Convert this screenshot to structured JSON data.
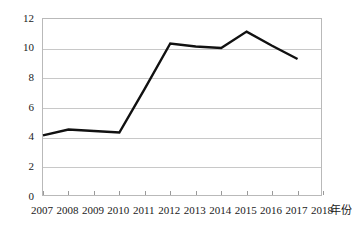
{
  "chart_data": {
    "type": "line",
    "title": "",
    "xlabel": "年份",
    "ylabel": "",
    "categories": [
      "2007",
      "2008",
      "2009",
      "2010",
      "2011",
      "2012",
      "2013",
      "2014",
      "2015",
      "2016",
      "2017",
      "2018"
    ],
    "x_tick_labels": [
      "2007",
      "2008",
      "2009",
      "2010",
      "2011",
      "2012",
      "2013",
      "2014",
      "2015",
      "2016",
      "2017",
      "2018"
    ],
    "y_tick_labels": [
      "0",
      "2",
      "4",
      "6",
      "8",
      "10",
      "12"
    ],
    "y_ticks": [
      0,
      2,
      4,
      6,
      8,
      10,
      12
    ],
    "ylim": [
      0,
      12
    ],
    "xlim": [
      "2007",
      "2018"
    ],
    "grid": "horizontal",
    "legend": "none",
    "series": [
      {
        "name": "series-1",
        "color": "#111111",
        "line_width": 2.4,
        "x": [
          "2007",
          "2008",
          "2009",
          "2010",
          "2011",
          "2012",
          "2013",
          "2014",
          "2015",
          "2016",
          "2017"
        ],
        "values": [
          4.15,
          4.55,
          4.45,
          4.35,
          7.3,
          10.35,
          10.15,
          10.05,
          11.15,
          10.2,
          9.3
        ]
      }
    ]
  },
  "axes": {
    "y_labels": [
      "12",
      "10",
      "8",
      "6",
      "4",
      "2",
      "0"
    ],
    "x_labels": [
      "2007",
      "2008",
      "2009",
      "2010",
      "2011",
      "2012",
      "2013",
      "2014",
      "2015",
      "2016",
      "2017",
      "2018"
    ],
    "x_axis_title": "年份"
  },
  "colors": {
    "line": "#111111",
    "grid": "#c8c8c8",
    "frame": "#b9b9b9",
    "background": "#ffffff",
    "text": "#1a1a1a"
  }
}
